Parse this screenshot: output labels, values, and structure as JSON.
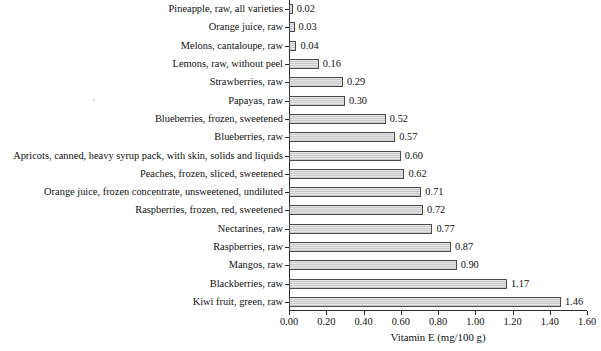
{
  "chart_data": {
    "type": "bar",
    "orientation": "horizontal",
    "title": "",
    "subtitle": "",
    "xlabel": "Vitamin E (mg/100 g)",
    "ylabel": "",
    "xlim": [
      0.0,
      1.6
    ],
    "xticks": [
      "0.00",
      "0.20",
      "0.40",
      "0.60",
      "0.80",
      "1.00",
      "1.20",
      "1.40",
      "1.60"
    ],
    "xtick_values": [
      0.0,
      0.2,
      0.4,
      0.6,
      0.8,
      1.0,
      1.2,
      1.4,
      1.6
    ],
    "grid": false,
    "legend": null,
    "legend_position": "none",
    "value_labels": true,
    "bar_fill": "#c9c9c9",
    "bar_border": "#4a4a4a",
    "categories": [
      "Pineapple, raw, all varieties",
      "Orange juice, raw",
      "Melons, cantaloupe, raw",
      "Lemons, raw, without peel",
      "Strawberries, raw",
      "Papayas, raw",
      "Blueberries, frozen, sweetened",
      "Blueberries, raw",
      "Apricots, canned, heavy syrup pack, with skin, solids and liquids",
      "Peaches, frozen, sliced, sweetened",
      "Orange juice, frozen concentrate, unsweetened, undiluted",
      "Raspberries, frozen, red, sweetened",
      "Nectarines, raw",
      "Raspberries, raw",
      "Mangos, raw",
      "Blackberries, raw",
      "Kiwi fruit, green, raw"
    ],
    "values": [
      0.02,
      0.03,
      0.04,
      0.16,
      0.29,
      0.3,
      0.52,
      0.57,
      0.6,
      0.62,
      0.71,
      0.72,
      0.77,
      0.87,
      0.9,
      1.17,
      1.46
    ],
    "value_text": [
      "0.02",
      "0.03",
      "0.04",
      "0.16",
      "0.29",
      "0.30",
      "0.52",
      "0.57",
      "0.60",
      "0.62",
      "0.71",
      "0.72",
      "0.77",
      "0.87",
      "0.90",
      "1.17",
      "1.46"
    ]
  }
}
